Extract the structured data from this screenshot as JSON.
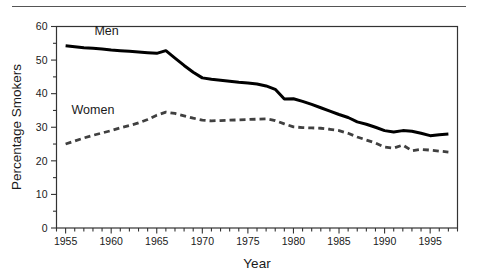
{
  "figure": {
    "name": "percentage-smokers-by-sex-line-chart",
    "top_rule_color": "#555555",
    "background_color": "#ffffff"
  },
  "chart_data": {
    "type": "line",
    "title": "",
    "subtitle": "",
    "xlabel": "Year",
    "ylabel": "Percentage Smokers",
    "xlim": [
      1954,
      1998
    ],
    "ylim": [
      0,
      60
    ],
    "y_ticks": [
      0,
      10,
      20,
      30,
      40,
      50,
      60
    ],
    "y_tick_labels": [
      "0",
      "10",
      "20",
      "30",
      "40",
      "50",
      "60"
    ],
    "y_minor_tick_step": 5,
    "x_ticks": [
      1955,
      1960,
      1965,
      1970,
      1975,
      1980,
      1985,
      1990,
      1995
    ],
    "x_tick_labels": [
      "1955",
      "1960",
      "1965",
      "1970",
      "1975",
      "1980",
      "1985",
      "1990",
      "1995"
    ],
    "x_minor_tick_step": 1,
    "grid": false,
    "legend_position": "inline-annotations",
    "annotations": [
      {
        "text": "Men",
        "x": 1959.5,
        "y": 57.5
      },
      {
        "text": "Women",
        "x": 1958.0,
        "y": 34.0
      }
    ],
    "x": [
      1955,
      1956,
      1957,
      1958,
      1959,
      1960,
      1961,
      1962,
      1963,
      1964,
      1965,
      1966,
      1967,
      1968,
      1969,
      1970,
      1971,
      1972,
      1973,
      1974,
      1975,
      1976,
      1977,
      1978,
      1979,
      1980,
      1981,
      1982,
      1983,
      1984,
      1985,
      1986,
      1987,
      1988,
      1989,
      1990,
      1991,
      1992,
      1993,
      1994,
      1995,
      1996,
      1997
    ],
    "series": [
      {
        "name": "Men",
        "style": "solid",
        "color": "#000000",
        "line_width": 3.0,
        "values": [
          54.3,
          54.0,
          53.7,
          53.5,
          53.3,
          53.0,
          52.8,
          52.6,
          52.4,
          52.2,
          52.0,
          52.8,
          50.6,
          48.4,
          46.4,
          44.7,
          44.3,
          44.0,
          43.7,
          43.4,
          43.2,
          42.9,
          42.3,
          41.3,
          38.4,
          38.5,
          37.7,
          36.8,
          35.8,
          34.8,
          33.8,
          32.9,
          31.6,
          30.9,
          30.0,
          29.0,
          28.6,
          29.0,
          28.8,
          28.2,
          27.5,
          27.8,
          28.0
        ]
      },
      {
        "name": "Women",
        "style": "dashed",
        "color": "#404040",
        "line_width": 2.8,
        "dash_pattern": "6,4",
        "values": [
          25.0,
          25.9,
          26.8,
          27.6,
          28.3,
          29.0,
          29.8,
          30.5,
          31.3,
          32.3,
          33.6,
          34.5,
          34.1,
          33.4,
          32.7,
          32.1,
          31.9,
          32.0,
          32.1,
          32.2,
          32.3,
          32.4,
          32.5,
          32.0,
          31.0,
          30.1,
          29.9,
          29.8,
          29.7,
          29.4,
          29.0,
          28.2,
          27.1,
          26.2,
          25.3,
          24.1,
          23.8,
          24.7,
          23.0,
          23.4,
          23.2,
          22.9,
          22.6
        ]
      }
    ]
  }
}
